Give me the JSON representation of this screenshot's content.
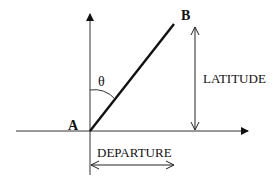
{
  "diagram": {
    "points": {
      "a": {
        "label": "A",
        "x": 90,
        "y": 131
      },
      "b": {
        "label": "B",
        "x": 174,
        "y": 24
      }
    },
    "angle": {
      "label": "θ"
    },
    "latitude": {
      "label": "LATITUDE"
    },
    "departure": {
      "label": "DEPARTURE"
    },
    "colors": {
      "line": "#111111",
      "axis": "#333333",
      "background": "#ffffff"
    }
  }
}
